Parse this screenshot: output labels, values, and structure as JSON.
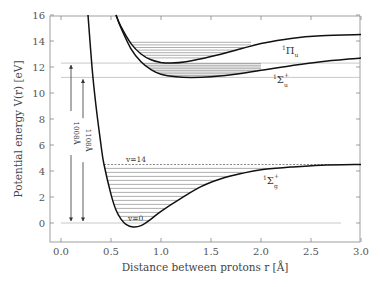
{
  "chart_data": {
    "type": "line",
    "title": "",
    "xlabel": "Distance between protons r [Å]",
    "ylabel": "Potential energy V(r) [eV]",
    "xlim": [
      -0.11,
      3.0
    ],
    "ylim": [
      -1.46,
      16
    ],
    "x_ticks": [
      "0.0",
      "0.5",
      "1.0",
      "1.5",
      "2.0",
      "2.5",
      "3.0"
    ],
    "y_ticks": [
      "0",
      "2",
      "4",
      "6",
      "8",
      "10",
      "12",
      "14",
      "16"
    ],
    "grid": false,
    "legend": "none",
    "series": [
      {
        "name": "1Σg+ (ground state)",
        "label_main": "Σ",
        "label_sup_pre": "1",
        "label_sup": "+",
        "label_sub": "g",
        "points": [
          [
            0.27,
            16
          ],
          [
            0.31,
            12
          ],
          [
            0.35,
            9
          ],
          [
            0.4,
            6
          ],
          [
            0.43,
            4.5
          ],
          [
            0.5,
            2.2
          ],
          [
            0.55,
            1.0
          ],
          [
            0.6,
            0.3
          ],
          [
            0.65,
            -0.1
          ],
          [
            0.72,
            -0.3
          ],
          [
            0.8,
            -0.2
          ],
          [
            0.9,
            0.3
          ],
          [
            1.0,
            0.9
          ],
          [
            1.2,
            1.9
          ],
          [
            1.4,
            2.8
          ],
          [
            1.6,
            3.4
          ],
          [
            1.8,
            3.8
          ],
          [
            2.0,
            4.1
          ],
          [
            2.3,
            4.3
          ],
          [
            2.6,
            4.45
          ],
          [
            3.0,
            4.5
          ]
        ]
      },
      {
        "name": "1Σu+",
        "label_main": "Σ",
        "label_sup_pre": "1",
        "label_sup": "+",
        "label_sub": "u",
        "points": [
          [
            0.55,
            16
          ],
          [
            0.6,
            15
          ],
          [
            0.7,
            13.4
          ],
          [
            0.8,
            12.4
          ],
          [
            0.9,
            11.8
          ],
          [
            1.0,
            11.45
          ],
          [
            1.15,
            11.25
          ],
          [
            1.3,
            11.2
          ],
          [
            1.5,
            11.25
          ],
          [
            1.8,
            11.5
          ],
          [
            2.0,
            11.75
          ],
          [
            2.3,
            12.1
          ],
          [
            2.6,
            12.4
          ],
          [
            3.0,
            12.7
          ]
        ]
      },
      {
        "name": "1Πu",
        "label_main": "Π",
        "label_sup_pre": "1",
        "label_sub": "u",
        "points": [
          [
            0.55,
            16
          ],
          [
            0.6,
            15.1
          ],
          [
            0.7,
            13.8
          ],
          [
            0.8,
            13.0
          ],
          [
            0.9,
            12.55
          ],
          [
            1.0,
            12.35
          ],
          [
            1.1,
            12.3
          ],
          [
            1.25,
            12.4
          ],
          [
            1.5,
            12.8
          ],
          [
            1.8,
            13.4
          ],
          [
            2.0,
            13.8
          ],
          [
            2.3,
            14.2
          ],
          [
            2.6,
            14.4
          ],
          [
            3.0,
            14.5
          ]
        ]
      }
    ],
    "vibrational_levels": {
      "ground": {
        "count": 15,
        "v_min_label": "v=0",
        "v_max_label": "v=14",
        "E_start": 0.0,
        "E_end": 4.5
      },
      "sigma_u": {
        "count": 8,
        "E_start": 11.2,
        "E_end": 12.2
      },
      "pi_u": {
        "count": 7,
        "E_start": 12.3,
        "E_end": 13.9
      }
    },
    "reference_lines": [
      {
        "y": 0,
        "label": ""
      },
      {
        "y": 12.3,
        "label": ""
      },
      {
        "y": 11.2,
        "label": ""
      }
    ],
    "annotations": [
      {
        "text": "1008Å",
        "type": "double-arrow",
        "x": 0.1,
        "y_from": 0,
        "y_to": 12.3
      },
      {
        "text": "1108Å",
        "type": "double-arrow",
        "x": 0.22,
        "y_from": 0,
        "y_to": 11.2
      },
      {
        "text": "v=14",
        "x": 0.6,
        "y": 4.7
      },
      {
        "text": "v=0",
        "x": 0.7,
        "y": 0.1
      }
    ]
  },
  "labels": {
    "xlabel": "Distance between protons r [Å]",
    "ylabel": "Potential energy V(r) [eV]",
    "arrow1": "1008Å",
    "arrow2": "1108Å",
    "v14": "v=14",
    "v0": "v=0",
    "pi_u": {
      "pre": "1",
      "main": "Π",
      "sub": "u"
    },
    "sigma_u": {
      "pre": "1",
      "main": "Σ",
      "sup": "+",
      "sub": "u"
    },
    "sigma_g": {
      "pre": "1",
      "main": "Σ",
      "sup": "+",
      "sub": "g"
    }
  }
}
